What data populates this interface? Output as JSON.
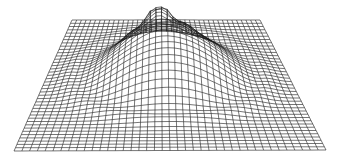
{
  "chart_data": {
    "type": "surface-wireframe",
    "title": "",
    "xlabel": "",
    "ylabel": "",
    "zlabel": "",
    "grid": {
      "rows": 40,
      "cols": 40
    },
    "projection": {
      "top_left": [
        72,
        20
      ],
      "top_right": [
        260,
        20
      ],
      "bottom_left": [
        14,
        151
      ],
      "bottom_right": [
        326,
        150
      ]
    },
    "surface": {
      "shape": "radial dome with central crater-like peak",
      "dome_center": [
        0.5,
        0.42
      ],
      "dome_height_px": 62,
      "dome_radius": 0.38,
      "peak_center": [
        0.46,
        0.3
      ],
      "peak_height_px": 22,
      "peak_radius": 0.11
    },
    "colors": {
      "line": "#1a1a1a",
      "background": "#ffffff"
    }
  }
}
